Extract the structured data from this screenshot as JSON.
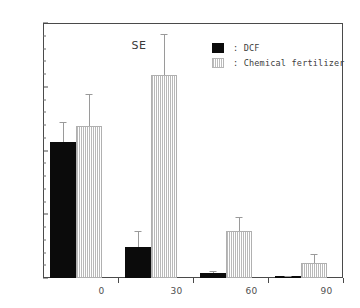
{
  "chart_data": {
    "type": "bar",
    "title": "",
    "subtitle": "",
    "xlabel": "",
    "ylabel": "",
    "categories": [
      "0",
      "30",
      "60",
      "90"
    ],
    "ylim": [
      0,
      200
    ],
    "xlim": [
      0,
      4
    ],
    "grid": false,
    "y_major_ticks": [
      0,
      50,
      100,
      150,
      200
    ],
    "y_major_tick_labels": [
      "0",
      "50",
      "100",
      "150",
      "200"
    ],
    "y_minor_tick_interval": 10,
    "legend_position": "top-right",
    "annotations": [
      {
        "text": "SE",
        "x_frac": 0.295,
        "y_value": 182
      }
    ],
    "series": [
      {
        "name": "DCF",
        "label": ": DCF",
        "color": "#0b0b0b",
        "fill": "solid-black",
        "values": [
          107,
          24,
          4,
          1
        ],
        "errors": [
          15,
          13,
          1.5,
          0.5
        ]
      },
      {
        "name": "Chemical fertilizer",
        "label": ": Chemical fertilizer",
        "color": "#bcbcbc",
        "fill": "vertical-hatch-gray",
        "values": [
          119,
          159,
          37,
          12
        ],
        "errors": [
          25,
          32,
          11,
          7
        ]
      }
    ]
  },
  "axis": {
    "frame_color": "#4a4a4a",
    "tick_label_color": "#4f4f4f"
  },
  "legend": {
    "entries": [
      {
        "swatch": "dcf",
        "text": ": DCF"
      },
      {
        "swatch": "chem",
        "text": ": Chemical fertilizer"
      }
    ]
  }
}
